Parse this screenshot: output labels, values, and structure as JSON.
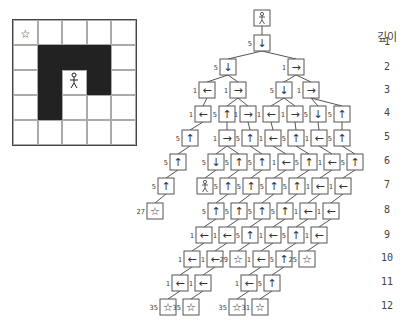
{
  "grid": {
    "rows": 5,
    "cols": 5,
    "walls": [
      [
        1,
        1
      ],
      [
        1,
        2
      ],
      [
        1,
        3
      ],
      [
        2,
        1
      ],
      [
        2,
        3
      ],
      [
        3,
        1
      ]
    ],
    "goal": {
      "row": 0,
      "col": 0,
      "icon": "star-icon",
      "glyph": "☆"
    },
    "agent": {
      "row": 2,
      "col": 2,
      "icon": "person-icon",
      "glyph": "🯅"
    }
  },
  "depth_header": "깊이",
  "depth_labels": [
    "1",
    "2",
    "3",
    "4",
    "5",
    "6",
    "7",
    "8",
    "9",
    "10",
    "11",
    "12"
  ],
  "tree": {
    "nodes": [
      {
        "id": 0,
        "x": 262,
        "y": 18,
        "glyph": "☺",
        "cost": "",
        "kind": "agent"
      },
      {
        "id": 1,
        "x": 262,
        "y": 43,
        "glyph": "↓",
        "cost": "5",
        "parent": 0
      },
      {
        "id": 2,
        "x": 228,
        "y": 67,
        "glyph": "↓",
        "cost": "5",
        "parent": 1
      },
      {
        "id": 3,
        "x": 296,
        "y": 67,
        "glyph": "→",
        "cost": "1",
        "parent": 1
      },
      {
        "id": 4,
        "x": 207,
        "y": 90,
        "glyph": "←",
        "cost": "1",
        "parent": 2
      },
      {
        "id": 5,
        "x": 238,
        "y": 90,
        "glyph": "→",
        "cost": "1",
        "parent": 2
      },
      {
        "id": 6,
        "x": 284,
        "y": 90,
        "glyph": "↓",
        "cost": "5",
        "parent": 3
      },
      {
        "id": 7,
        "x": 311,
        "y": 90,
        "glyph": "→",
        "cost": "1",
        "parent": 3
      },
      {
        "id": 8,
        "x": 203,
        "y": 114,
        "glyph": "←",
        "cost": "1",
        "parent": 4
      },
      {
        "id": 9,
        "x": 227,
        "y": 114,
        "glyph": "↑",
        "cost": "5",
        "parent": 5
      },
      {
        "id": 10,
        "x": 248,
        "y": 114,
        "glyph": "→",
        "cost": "1",
        "parent": 5
      },
      {
        "id": 11,
        "x": 271,
        "y": 114,
        "glyph": "←",
        "cost": "1",
        "parent": 6
      },
      {
        "id": 12,
        "x": 295,
        "y": 114,
        "glyph": "→",
        "cost": "1",
        "parent": 6
      },
      {
        "id": 13,
        "x": 318,
        "y": 114,
        "glyph": "↓",
        "cost": "5",
        "parent": 7
      },
      {
        "id": 14,
        "x": 342,
        "y": 114,
        "glyph": "↑",
        "cost": "5",
        "parent": 7
      },
      {
        "id": 15,
        "x": 190,
        "y": 138,
        "glyph": "↑",
        "cost": "5",
        "parent": 8
      },
      {
        "id": 16,
        "x": 227,
        "y": 138,
        "glyph": "→",
        "cost": "1",
        "parent": 9
      },
      {
        "id": 17,
        "x": 250,
        "y": 138,
        "glyph": "↑",
        "cost": "5",
        "parent": 10
      },
      {
        "id": 18,
        "x": 273,
        "y": 138,
        "glyph": "←",
        "cost": "1",
        "parent": 11
      },
      {
        "id": 19,
        "x": 296,
        "y": 138,
        "glyph": "↑",
        "cost": "5",
        "parent": 12
      },
      {
        "id": 20,
        "x": 319,
        "y": 138,
        "glyph": "←",
        "cost": "1",
        "parent": 13
      },
      {
        "id": 21,
        "x": 342,
        "y": 138,
        "glyph": "↑",
        "cost": "5",
        "parent": 14
      },
      {
        "id": 22,
        "x": 178,
        "y": 162,
        "glyph": "↑",
        "cost": "5",
        "parent": 15
      },
      {
        "id": 23,
        "x": 216,
        "y": 162,
        "glyph": "↓",
        "cost": "5",
        "parent": 16
      },
      {
        "id": 24,
        "x": 239,
        "y": 162,
        "glyph": "↑",
        "cost": "5",
        "parent": 16
      },
      {
        "id": 25,
        "x": 262,
        "y": 162,
        "glyph": "↑",
        "cost": "5",
        "parent": 17
      },
      {
        "id": 26,
        "x": 286,
        "y": 162,
        "glyph": "←",
        "cost": "1",
        "parent": 18
      },
      {
        "id": 27,
        "x": 309,
        "y": 162,
        "glyph": "↑",
        "cost": "5",
        "parent": 19
      },
      {
        "id": 28,
        "x": 332,
        "y": 162,
        "glyph": "←",
        "cost": "1",
        "parent": 20
      },
      {
        "id": 29,
        "x": 355,
        "y": 162,
        "glyph": "↑",
        "cost": "5",
        "parent": 21
      },
      {
        "id": 30,
        "x": 166,
        "y": 186,
        "glyph": "↑",
        "cost": "5",
        "parent": 22
      },
      {
        "id": 31,
        "x": 205,
        "y": 186,
        "glyph": "☺",
        "cost": "",
        "kind": "agent",
        "parent": 23
      },
      {
        "id": 32,
        "x": 228,
        "y": 186,
        "glyph": "↑",
        "cost": "5",
        "parent": 24
      },
      {
        "id": 33,
        "x": 251,
        "y": 186,
        "glyph": "↑",
        "cost": "5",
        "parent": 25
      },
      {
        "id": 34,
        "x": 274,
        "y": 186,
        "glyph": "↑",
        "cost": "5",
        "parent": 26
      },
      {
        "id": 35,
        "x": 297,
        "y": 186,
        "glyph": "↑",
        "cost": "5",
        "parent": 27
      },
      {
        "id": 36,
        "x": 320,
        "y": 186,
        "glyph": "←",
        "cost": "1",
        "parent": 28
      },
      {
        "id": 37,
        "x": 343,
        "y": 186,
        "glyph": "←",
        "cost": "1",
        "parent": 29
      },
      {
        "id": 38,
        "x": 155,
        "y": 211,
        "glyph": "☆",
        "cost": "27",
        "kind": "goal",
        "parent": 30
      },
      {
        "id": 39,
        "x": 216,
        "y": 211,
        "glyph": "↑",
        "cost": "5",
        "parent": 32
      },
      {
        "id": 40,
        "x": 239,
        "y": 211,
        "glyph": "↑",
        "cost": "5",
        "parent": 33
      },
      {
        "id": 41,
        "x": 262,
        "y": 211,
        "glyph": "↑",
        "cost": "5",
        "parent": 34
      },
      {
        "id": 42,
        "x": 285,
        "y": 211,
        "glyph": "↑",
        "cost": "5",
        "parent": 35
      },
      {
        "id": 43,
        "x": 308,
        "y": 211,
        "glyph": "←",
        "cost": "1",
        "parent": 36
      },
      {
        "id": 44,
        "x": 331,
        "y": 211,
        "glyph": "←",
        "cost": "1",
        "parent": 37
      },
      {
        "id": 45,
        "x": 204,
        "y": 235,
        "glyph": "←",
        "cost": "1",
        "parent": 39
      },
      {
        "id": 46,
        "x": 227,
        "y": 235,
        "glyph": "←",
        "cost": "1",
        "parent": 40
      },
      {
        "id": 47,
        "x": 250,
        "y": 235,
        "glyph": "↑",
        "cost": "5",
        "parent": 41
      },
      {
        "id": 48,
        "x": 273,
        "y": 235,
        "glyph": "←",
        "cost": "1",
        "parent": 42
      },
      {
        "id": 49,
        "x": 296,
        "y": 235,
        "glyph": "↑",
        "cost": "5",
        "parent": 43
      },
      {
        "id": 50,
        "x": 319,
        "y": 235,
        "glyph": "←",
        "cost": "1",
        "parent": 44
      },
      {
        "id": 51,
        "x": 192,
        "y": 259,
        "glyph": "←",
        "cost": "1",
        "parent": 45
      },
      {
        "id": 52,
        "x": 215,
        "y": 259,
        "glyph": "←",
        "cost": "1",
        "parent": 46
      },
      {
        "id": 53,
        "x": 238,
        "y": 259,
        "glyph": "☆",
        "cost": "29",
        "kind": "goal",
        "parent": 47
      },
      {
        "id": 54,
        "x": 261,
        "y": 259,
        "glyph": "←",
        "cost": "1",
        "parent": 48
      },
      {
        "id": 55,
        "x": 284,
        "y": 259,
        "glyph": "↑",
        "cost": "5",
        "parent": 49
      },
      {
        "id": 56,
        "x": 307,
        "y": 259,
        "glyph": "☆",
        "cost": "25",
        "kind": "goal",
        "parent": 50
      },
      {
        "id": 57,
        "x": 180,
        "y": 283,
        "glyph": "←",
        "cost": "1",
        "parent": 51
      },
      {
        "id": 58,
        "x": 203,
        "y": 283,
        "glyph": "←",
        "cost": "1",
        "parent": 52
      },
      {
        "id": 59,
        "x": 249,
        "y": 283,
        "glyph": "←",
        "cost": "1",
        "parent": 54
      },
      {
        "id": 60,
        "x": 272,
        "y": 283,
        "glyph": "↑",
        "cost": "5",
        "parent": 55
      },
      {
        "id": 61,
        "x": 168,
        "y": 307,
        "glyph": "☆",
        "cost": "35",
        "kind": "goal",
        "parent": 57
      },
      {
        "id": 62,
        "x": 191,
        "y": 307,
        "glyph": "☆",
        "cost": "35",
        "kind": "goal",
        "parent": 58
      },
      {
        "id": 63,
        "x": 237,
        "y": 307,
        "glyph": "☆",
        "cost": "35",
        "kind": "goal",
        "parent": 59
      },
      {
        "id": 64,
        "x": 260,
        "y": 307,
        "glyph": "☆",
        "cost": "31",
        "kind": "goal",
        "parent": 60
      }
    ]
  }
}
